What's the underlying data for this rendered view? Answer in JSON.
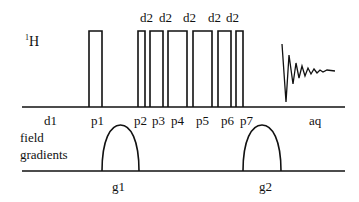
{
  "diagram": {
    "type": "nmr-pulse-sequence",
    "channels": [
      {
        "id": "H",
        "label_sup": "1",
        "label_main": "H"
      },
      {
        "id": "grad",
        "label_line1": "field",
        "label_line2": "gradients"
      }
    ],
    "delay_labels_top": [
      "d2",
      "d2",
      "d2",
      "d2",
      "d2"
    ],
    "timing_labels": [
      "d1",
      "p1",
      "p2",
      "p3",
      "p4",
      "p5",
      "p6",
      "p7",
      "aq"
    ],
    "gradient_labels": [
      "g1",
      "g2"
    ],
    "pulses": [
      {
        "name": "p1",
        "x": 89,
        "w": 13
      },
      {
        "name": "p2",
        "x": 138,
        "w": 7
      },
      {
        "name": "p3",
        "x": 150,
        "w": 13
      },
      {
        "name": "p4",
        "x": 168,
        "w": 19
      },
      {
        "name": "p5",
        "x": 193,
        "w": 19
      },
      {
        "name": "p6",
        "x": 218,
        "w": 13
      },
      {
        "name": "p7",
        "x": 236,
        "w": 7
      }
    ],
    "gradients": [
      {
        "name": "g1",
        "x1": 102,
        "x2": 139
      },
      {
        "name": "g2",
        "x1": 243,
        "x2": 281
      }
    ],
    "line_color": "#111111"
  }
}
